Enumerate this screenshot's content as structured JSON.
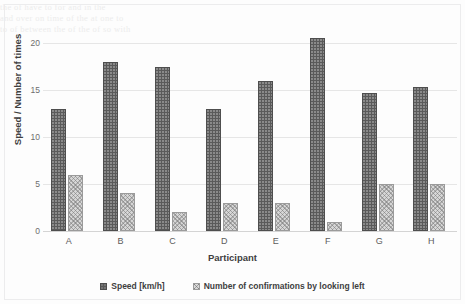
{
  "ghost_text": {
    "line1": "the  of  have   to       for  and         in   the",
    "line2": "and  over  on   time    of   the  at   one       to",
    "line3": "to   of  between  the  of  the  of  so      with"
  },
  "chart_data": {
    "type": "bar",
    "title": "",
    "xlabel": "Participant",
    "ylabel": "Speed / Number of times",
    "categories": [
      "A",
      "B",
      "C",
      "D",
      "E",
      "F",
      "G",
      "H"
    ],
    "series": [
      {
        "name": "Speed [km/h]",
        "color": "#5a5a5a",
        "pattern": "dotted",
        "values": [
          13,
          18,
          17.5,
          13,
          16,
          20.5,
          14.7,
          15.3
        ]
      },
      {
        "name": "Number of confirmations by looking left",
        "color": "#d6d6d6",
        "pattern": "crosshatch",
        "values": [
          6,
          4,
          2,
          3,
          3,
          1,
          5,
          5
        ]
      }
    ],
    "yticks": [
      0,
      5,
      10,
      15,
      20
    ],
    "ylim": [
      0,
      20
    ],
    "grid": true,
    "legend_position": "bottom"
  }
}
